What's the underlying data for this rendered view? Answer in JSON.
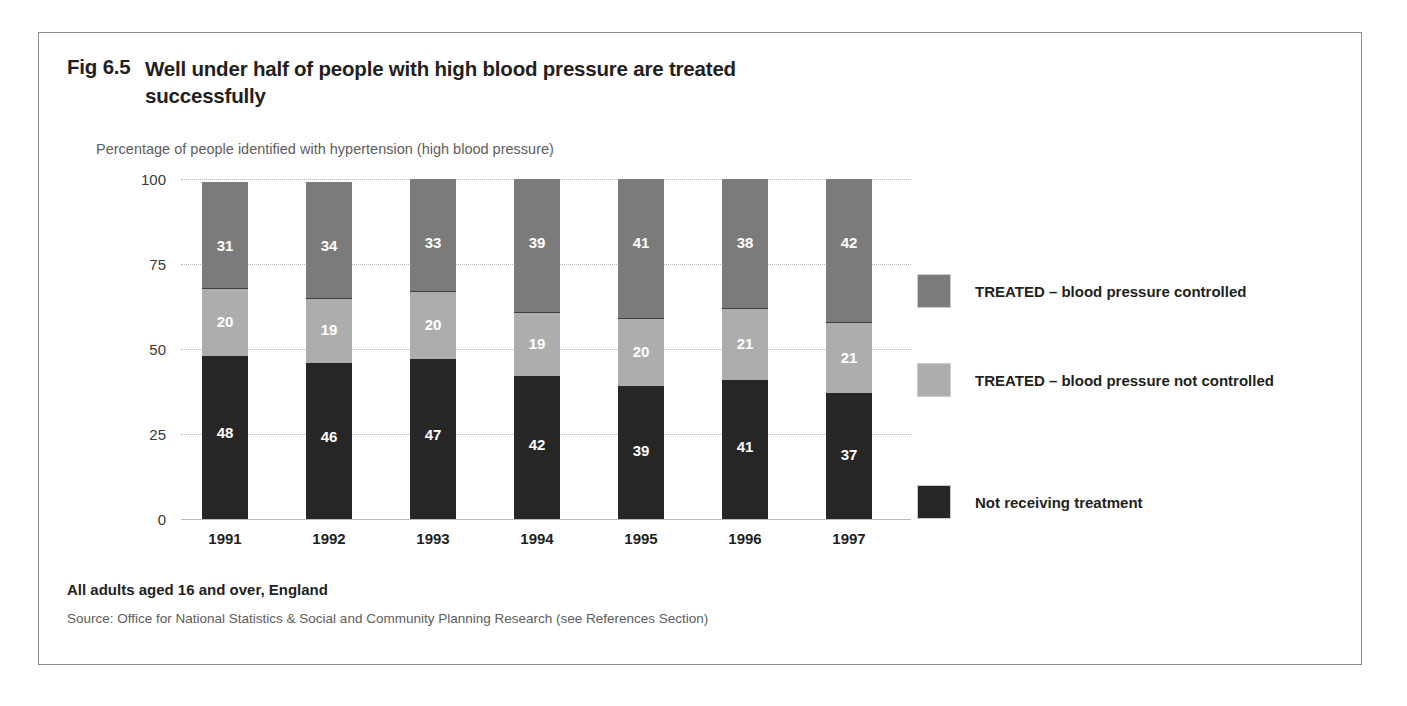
{
  "figure": {
    "number": "Fig 6.5",
    "title": "Well under half of people with high blood pressure are treated successfully",
    "subtitle": "Percentage of people identified with hypertension (high blood pressure)",
    "footnote": "All adults aged 16 and over, England",
    "source": "Source: Office for National Statistics & Social and Community Planning Research (see References Section)"
  },
  "colors": {
    "treated_controlled": "#7b7b7b",
    "treated_not_controlled": "#adadad",
    "not_receiving_treatment": "#262626",
    "frame_border": "#8a8a8a",
    "gridline": "#b9b9b9",
    "text": "#231f20",
    "muted_text": "#5d5d5d"
  },
  "legend": {
    "position": "right",
    "items": [
      {
        "label": "TREATED – blood pressure controlled",
        "color": "#7b7b7b"
      },
      {
        "label": "TREATED – blood pressure not controlled",
        "color": "#adadad"
      },
      {
        "label": "Not receiving treatment",
        "color": "#262626"
      }
    ]
  },
  "chart_data": {
    "type": "bar",
    "stacked": true,
    "title": "Well under half of people with high blood pressure are treated successfully",
    "subtitle": "Percentage of people identified with hypertension (high blood pressure)",
    "xlabel": "",
    "ylabel": "",
    "ylim": [
      0,
      100
    ],
    "yticks": [
      0,
      25,
      50,
      75,
      100
    ],
    "ytick_labels": [
      "0",
      "25",
      "50",
      "75",
      "100"
    ],
    "grid": true,
    "categories": [
      "1991",
      "1992",
      "1993",
      "1994",
      "1995",
      "1996",
      "1997"
    ],
    "series": [
      {
        "name": "Not receiving treatment",
        "color": "#262626",
        "values": [
          48,
          46,
          47,
          42,
          39,
          41,
          37
        ]
      },
      {
        "name": "TREATED – blood pressure not controlled",
        "color": "#adadad",
        "values": [
          20,
          19,
          20,
          19,
          20,
          21,
          21
        ]
      },
      {
        "name": "TREATED – blood pressure controlled",
        "color": "#7b7b7b",
        "values": [
          31,
          34,
          33,
          39,
          41,
          38,
          42
        ]
      }
    ],
    "data_labels": true
  }
}
